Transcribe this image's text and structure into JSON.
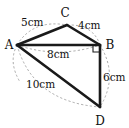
{
  "figure": {
    "background_color": "#ffffff",
    "edge_color": "#1a1a1a",
    "arc_color": "#9a9a9a",
    "label_color": "#111111"
  },
  "vertices": [
    {
      "id": "A",
      "label": "A",
      "x": 17,
      "y": 45,
      "label_x": 9,
      "label_y": 49
    },
    {
      "id": "C",
      "label": "C",
      "x": 67,
      "y": 25,
      "label_x": 63,
      "label_y": 16
    },
    {
      "id": "B",
      "label": "B",
      "x": 100,
      "y": 45,
      "label_x": 108,
      "label_y": 49
    },
    {
      "id": "D",
      "label": "D",
      "x": 100,
      "y": 107,
      "label_x": 96,
      "label_y": 124
    }
  ],
  "edges": [
    {
      "id": "AC",
      "from": "A",
      "to": "C",
      "length_label": "5cm"
    },
    {
      "id": "CB",
      "from": "C",
      "to": "B",
      "length_label": "4cm"
    },
    {
      "id": "AB",
      "from": "A",
      "to": "B",
      "length_label": "8cm"
    },
    {
      "id": "BD",
      "from": "B",
      "to": "D",
      "length_label": "6cm"
    },
    {
      "id": "AD",
      "from": "A",
      "to": "D",
      "length_label": "10cm"
    }
  ],
  "measurements": [
    {
      "id": "ac-length",
      "text": "5cm",
      "x": 21,
      "y": 26
    },
    {
      "id": "cb-length",
      "text": "4cm",
      "x": 78,
      "y": 29
    },
    {
      "id": "ab-length",
      "text": "8cm",
      "x": 47,
      "y": 58
    },
    {
      "id": "bd-length",
      "text": "6cm",
      "x": 103,
      "y": 81
    },
    {
      "id": "ad-length",
      "text": "10cm",
      "x": 30,
      "y": 88
    }
  ],
  "angles": [
    {
      "id": "right-angle-B",
      "at": "B",
      "marker": "right-angle-square",
      "degrees": 90
    }
  ]
}
